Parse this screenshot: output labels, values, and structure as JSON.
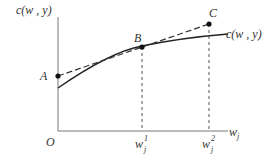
{
  "diagram": {
    "y_axis_label": "c(w , y)",
    "x_axis_label_base": "w",
    "x_axis_label_sub": "j",
    "origin_label": "O",
    "curve_label": "c(w , y)",
    "points": {
      "A": "A",
      "B": "B",
      "C": "C"
    },
    "ticks": [
      {
        "base": "w",
        "sub": "j",
        "sup": "1"
      },
      {
        "base": "w",
        "sub": "j",
        "sup": "2"
      }
    ],
    "colors": {
      "axis": "#777777",
      "curve": "#222222",
      "dashed": "#333333",
      "point": "#111111"
    }
  }
}
